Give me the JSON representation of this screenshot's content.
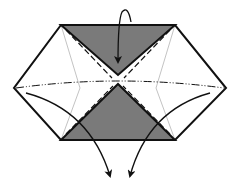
{
  "diagram": {
    "type": "origami-fold-diagram",
    "colors": {
      "outline": "#111111",
      "shaded": "#7a7a7a",
      "paper": "#ffffff",
      "crease": "#999999"
    },
    "shapes": {
      "hexagon": "61,25 175,25 226,88 175,140 61,140 14,88",
      "top_triangle": "61,25 175,25 118,75",
      "bottom_triangle": "61,140 175,140 118,84"
    },
    "lines": {
      "mountain_fold": "horizontal dash-dot-dot line across middle",
      "valley_folds": "dashed lines along triangle edges",
      "creases": "thin diagonal creases"
    },
    "arrows": [
      {
        "name": "fold-down-arrow",
        "description": "curved arrow folding top flap down"
      },
      {
        "name": "fold-left-arrow",
        "description": "curved arrow from left corner going down"
      },
      {
        "name": "fold-right-arrow",
        "description": "curved arrow from right corner going down"
      }
    ]
  }
}
